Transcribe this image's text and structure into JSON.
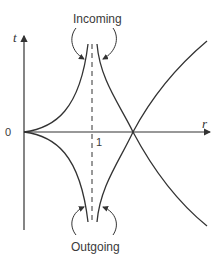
{
  "diagram": {
    "axes": {
      "vertical_label": "t",
      "horizontal_label": "r",
      "origin_label": "0",
      "tick_label": "1"
    },
    "annotations": {
      "top": "Incoming",
      "bottom": "Outgoing"
    },
    "colors": {
      "stroke": "#333333",
      "background": "#ffffff"
    }
  }
}
